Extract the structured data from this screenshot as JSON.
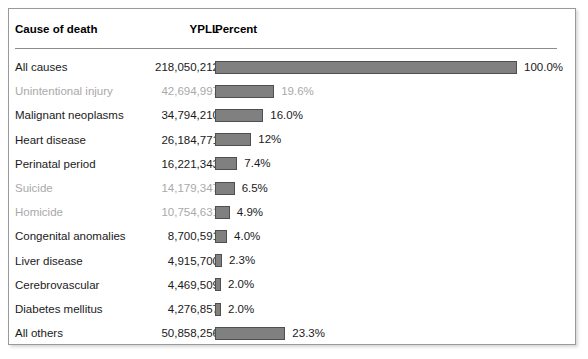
{
  "panel": {
    "accent_bar_color": "#808080",
    "bar_border_color": "#4f4f4f",
    "dim_text_color": "#a9a9a9",
    "text_color": "#1a1a1a",
    "rule_color": "#8c8c8c",
    "border_color": "#9a9a9a"
  },
  "header": {
    "cause": "Cause of death",
    "ypll": "YPLL",
    "percent": "Percent"
  },
  "chart_data": {
    "type": "bar",
    "title": "",
    "xlabel": "Percent",
    "ylabel": "Cause of death",
    "orientation": "horizontal",
    "grid": false,
    "legend": "none",
    "xlim": [
      0,
      100
    ],
    "max_bar_px": 302,
    "categories": [
      "All causes",
      "Unintentional injury",
      "Malignant neoplasms",
      "Heart disease",
      "Perinatal period",
      "Suicide",
      "Homicide",
      "Congenital anomalies",
      "Liver disease",
      "Cerebrovascular",
      "Diabetes mellitus",
      "All others"
    ],
    "values": [
      100.0,
      19.6,
      16.0,
      12.0,
      7.4,
      6.5,
      4.9,
      4.0,
      2.3,
      2.0,
      2.0,
      23.3
    ],
    "ypll": [
      218050212,
      42694997,
      34794210,
      26184771,
      16221343,
      14179347,
      10754631,
      8700591,
      4915700,
      4469509,
      4276857,
      50858256
    ]
  },
  "rows": [
    {
      "cause": "All causes",
      "ypll": "218,050,212",
      "percent_label": "100.0%",
      "percent_value": 100.0,
      "dim": false,
      "label_dim": false
    },
    {
      "cause": "Unintentional injury",
      "ypll": "42,694,997",
      "percent_label": "19.6%",
      "percent_value": 19.6,
      "dim": true,
      "label_dim": true
    },
    {
      "cause": "Malignant neoplasms",
      "ypll": "34,794,210",
      "percent_label": "16.0%",
      "percent_value": 16.0,
      "dim": false,
      "label_dim": false
    },
    {
      "cause": "Heart disease",
      "ypll": "26,184,771",
      "percent_label": "12%",
      "percent_value": 12.0,
      "dim": false,
      "label_dim": false
    },
    {
      "cause": "Perinatal period",
      "ypll": "16,221,343",
      "percent_label": "7.4%",
      "percent_value": 7.4,
      "dim": false,
      "label_dim": false
    },
    {
      "cause": "Suicide",
      "ypll": "14,179,347",
      "percent_label": "6.5%",
      "percent_value": 6.5,
      "dim": true,
      "label_dim": false
    },
    {
      "cause": "Homicide",
      "ypll": "10,754,631",
      "percent_label": "4.9%",
      "percent_value": 4.9,
      "dim": true,
      "label_dim": false
    },
    {
      "cause": "Congenital anomalies",
      "ypll": "8,700,591",
      "percent_label": "4.0%",
      "percent_value": 4.0,
      "dim": false,
      "label_dim": false
    },
    {
      "cause": "Liver disease",
      "ypll": "4,915,700",
      "percent_label": "2.3%",
      "percent_value": 2.3,
      "dim": false,
      "label_dim": false
    },
    {
      "cause": "Cerebrovascular",
      "ypll": "4,469,509",
      "percent_label": "2.0%",
      "percent_value": 2.0,
      "dim": false,
      "label_dim": false
    },
    {
      "cause": "Diabetes mellitus",
      "ypll": "4,276,857",
      "percent_label": "2.0%",
      "percent_value": 2.0,
      "dim": false,
      "label_dim": false
    },
    {
      "cause": "All others",
      "ypll": "50,858,256",
      "percent_label": "23.3%",
      "percent_value": 23.3,
      "dim": false,
      "label_dim": false
    }
  ]
}
